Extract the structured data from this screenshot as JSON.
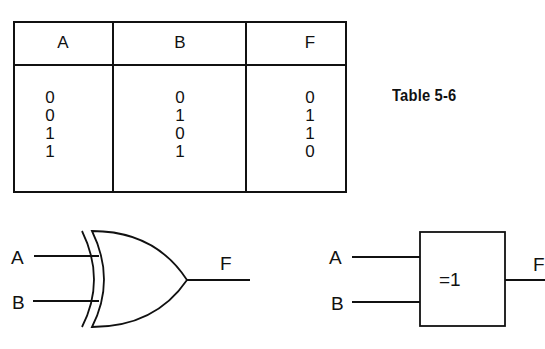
{
  "table": {
    "caption": "Table 5-6",
    "headers": [
      "A",
      "B",
      "F"
    ],
    "rows": [
      [
        "0",
        "0",
        "0"
      ],
      [
        "0",
        "1",
        "1"
      ],
      [
        "1",
        "0",
        "1"
      ],
      [
        "1",
        "1",
        "0"
      ]
    ]
  },
  "gates": {
    "distinctive_shape": {
      "type": "XOR",
      "inputs": [
        "A",
        "B"
      ],
      "output": "F"
    },
    "rectangular_shape": {
      "type": "XOR",
      "symbol": "=1",
      "inputs": [
        "A",
        "B"
      ],
      "output": "F"
    }
  }
}
